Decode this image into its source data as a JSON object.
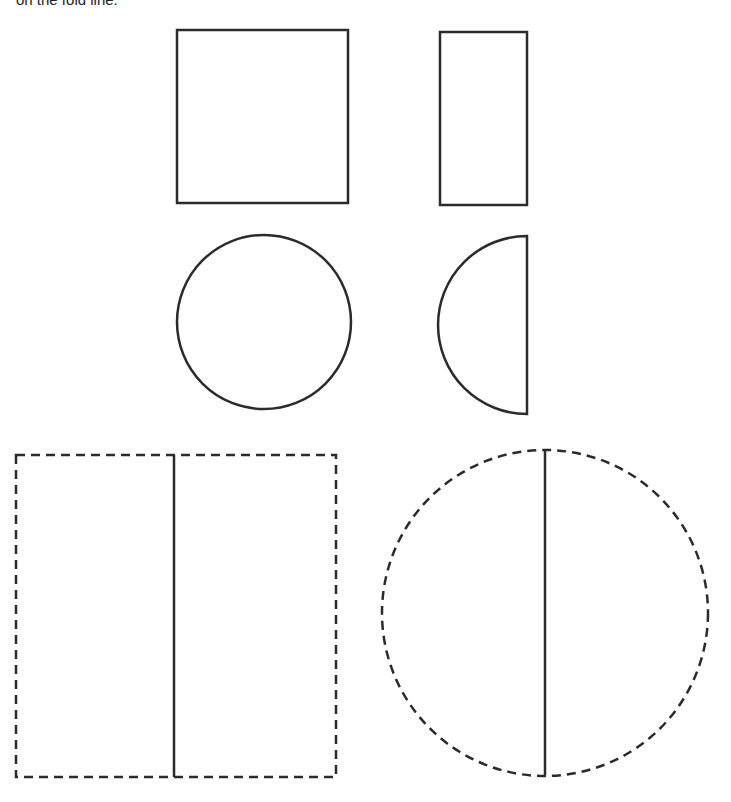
{
  "caption": "on the fold line.",
  "colors": {
    "stroke": "#2b2b2b",
    "background": "#ffffff"
  },
  "shapes": [
    {
      "name": "square",
      "type": "rect",
      "style": "solid",
      "x": 177,
      "y": 30,
      "w": 171,
      "h": 173
    },
    {
      "name": "half-rectangle",
      "type": "rect",
      "style": "solid",
      "x": 440,
      "y": 32,
      "w": 87,
      "h": 173
    },
    {
      "name": "circle",
      "type": "circle",
      "style": "solid",
      "cx": 264,
      "cy": 322,
      "r": 87
    },
    {
      "name": "half-circle",
      "type": "semicircle",
      "style": "solid",
      "fold_x": 527,
      "y1": 236,
      "y2": 414
    },
    {
      "name": "dashed-rectangle",
      "type": "rect",
      "style": "dashed",
      "x": 16,
      "y": 455,
      "w": 320,
      "h": 322,
      "fold_x": 174
    },
    {
      "name": "dashed-circle",
      "type": "circle",
      "style": "dashed",
      "cx": 545,
      "cy": 613,
      "r": 163,
      "fold_x": 545
    }
  ]
}
